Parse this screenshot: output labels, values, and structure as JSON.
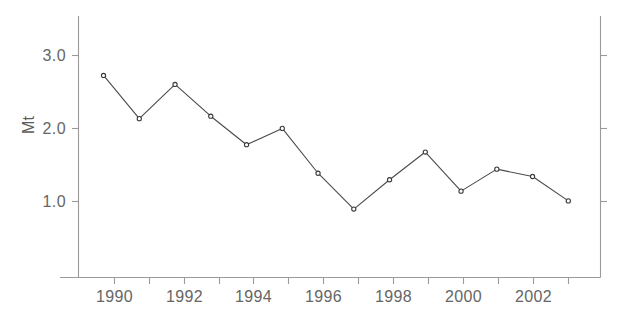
{
  "chart_data": {
    "type": "line",
    "title": "",
    "subtitle": "",
    "xlabel": "",
    "ylabel": "Mt",
    "x": [
      1990,
      1991,
      1992,
      1993,
      1994,
      1995,
      1996,
      1997,
      1998,
      1999,
      2000,
      2001,
      2002,
      2003
    ],
    "categories": [
      "1990",
      "1991",
      "1992",
      "1993",
      "1994",
      "1995",
      "1996",
      "1997",
      "1998",
      "1999",
      "2000",
      "2001",
      "2002",
      "2003"
    ],
    "values": [
      2.75,
      2.22,
      2.64,
      2.25,
      1.9,
      2.1,
      1.55,
      1.11,
      1.47,
      1.81,
      1.33,
      1.6,
      1.51,
      1.21
    ],
    "series": [
      {
        "name": "Mt",
        "values": [
          2.75,
          2.22,
          2.64,
          2.25,
          1.9,
          2.1,
          1.55,
          1.11,
          1.47,
          1.81,
          1.33,
          1.6,
          1.51,
          1.21
        ]
      }
    ],
    "xlim": [
      1989.3,
      2003.9
    ],
    "ylim": [
      0.27,
      3.48
    ],
    "ytick_values": [
      1.0,
      2.0,
      3.0
    ],
    "ytick_labels": [
      "1.0",
      "2.0",
      "3.0"
    ],
    "xtick_values": [
      1990,
      1991,
      1992,
      1993,
      1994,
      1995,
      1996,
      1997,
      1998,
      1999,
      2000,
      2001,
      2002,
      2003
    ],
    "xtick_labels": [
      "1990",
      "",
      "1992",
      "",
      "1994",
      "",
      "1996",
      "",
      "1998",
      "",
      "2000",
      "",
      "2002",
      ""
    ],
    "grid": false,
    "legend": false,
    "legend_position": "none",
    "marker": "open-circle",
    "line_color": "#4a4a4a",
    "axis_color": "#9a9a9a",
    "text_color": "#666666",
    "background": "#ffffff",
    "right_axis_ticks": true,
    "annotations": []
  },
  "axes": {
    "y_title": "Mt",
    "y_labels": [
      "3.0",
      "2.0",
      "1.0"
    ],
    "x_labels": [
      "1990",
      "1992",
      "1994",
      "1996",
      "1998",
      "2000",
      "2002"
    ]
  }
}
